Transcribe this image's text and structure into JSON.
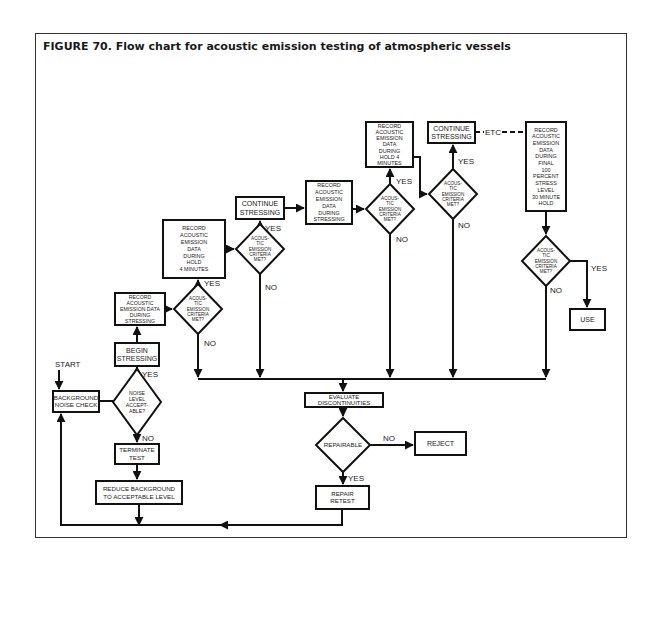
{
  "figure": {
    "title": "FIGURE 70. Flow chart for acoustic emission testing of atmospheric vessels"
  },
  "nodes": {
    "start": "START",
    "background_noise_check": [
      "BACKGROUND",
      "NOISE CHECK"
    ],
    "noise_level_acceptable": [
      "NOISE",
      "LEVEL",
      "ACCEPT-",
      "ABLE?"
    ],
    "terminate_test": [
      "TERMINATE",
      "TEST"
    ],
    "reduce_background": [
      "REDUCE BACKGROUND",
      "TO ACCEPTABLE LEVEL"
    ],
    "begin_stressing": [
      "BEGIN",
      "STRESSING"
    ],
    "record_during_stressing_1": [
      "RECORD",
      "ACOUSTIC",
      "EMISSION DATA",
      "DURING",
      "STRESSING"
    ],
    "criteria_1": [
      "ACOUS-",
      "TIC",
      "EMISSION",
      "CRITERIA",
      "MET?"
    ],
    "record_hold_1": [
      "RECORD",
      "ACOUSTIC",
      "EMISSION",
      "DATA",
      "DURING",
      "HOLD",
      "4 MINUTES"
    ],
    "criteria_2": [
      "ACOUS-",
      "TIC",
      "EMISSION",
      "CRITERIA",
      "MET?"
    ],
    "continue_stressing_1": [
      "CONTINUE",
      "STRESSING"
    ],
    "record_during_stressing_2": [
      "RECORD",
      "ACOUSTIC",
      "EMISSION",
      "DATA",
      "DURING",
      "STRESSING"
    ],
    "criteria_3": [
      "ACOUS-",
      "TIC",
      "EMISSION",
      "CRITERIA",
      "MET?"
    ],
    "record_hold_2": [
      "RECORD",
      "ACOUSTIC",
      "EMISSION",
      "DATA",
      "DURING",
      "HOLD 4",
      "MINUTES"
    ],
    "criteria_4": [
      "ACOUS-",
      "TIC",
      "EMISSION",
      "CRITERIA",
      "MET?"
    ],
    "continue_stressing_2": [
      "CONTINUE",
      "STRESSING"
    ],
    "etc": "ETC",
    "record_final": [
      "RECORD",
      "ACOUSTIC",
      "EMISSION",
      "DATA",
      "DURING",
      "FINAL",
      "100",
      "PERCENT",
      "STRESS",
      "LEVEL",
      "30 MINUTE",
      "HOLD"
    ],
    "criteria_5": [
      "ACOUS-",
      "TIC",
      "EMISSION",
      "CRITERIA",
      "MET?"
    ],
    "use": "USE",
    "evaluate_discontinuities": [
      "EVALUATE",
      "DISCONTINUITIES"
    ],
    "repairable": "REPAIRABLE",
    "reject": "REJECT",
    "repair_retest": [
      "REPAIR",
      "RETEST"
    ]
  },
  "labels": {
    "yes": "YES",
    "no": "NO"
  }
}
